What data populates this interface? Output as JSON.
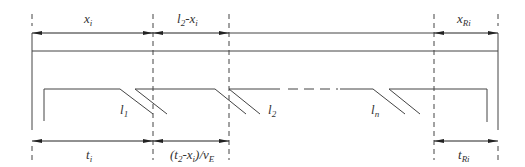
{
  "diagram": {
    "stroke_color": "#444444",
    "top_dimensions": [
      {
        "id": "xi",
        "base": "x",
        "sub": "i",
        "suffix": ""
      },
      {
        "id": "l2-xi",
        "base": "l",
        "sub": "2",
        "suffix": "-x",
        "suffix_sub": "i"
      },
      {
        "id": "xRi",
        "base": "x",
        "sub": "Ri",
        "suffix": ""
      }
    ],
    "bottom_dimensions": [
      {
        "id": "ti",
        "base": "t",
        "sub": "i"
      },
      {
        "id": "t2-xi-vE",
        "prefix": "(",
        "base": "t",
        "sub": "2",
        "mid": "-x",
        "mid_sub": "i",
        "tail": ")/v",
        "tail_sub": "E"
      },
      {
        "id": "tRi",
        "base": "t",
        "sub": "Ri"
      }
    ],
    "segment_labels": [
      {
        "id": "l1",
        "base": "l",
        "sub": "1"
      },
      {
        "id": "l2",
        "base": "l",
        "sub": "2"
      },
      {
        "id": "ln",
        "base": "l",
        "sub": "n"
      }
    ]
  }
}
